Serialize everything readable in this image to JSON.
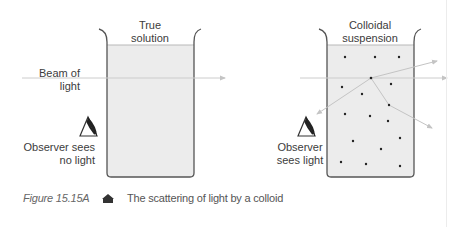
{
  "figure": {
    "caption": {
      "number": "Figure 15.15A",
      "text": "The scattering of light by a colloid"
    },
    "panels": [
      {
        "id": "true-solution",
        "title_line1": "True",
        "title_line2": "solution",
        "beam_label_line1": "Beam of",
        "beam_label_line2": "light",
        "observer_line1": "Observer sees",
        "observer_line2": "no light"
      },
      {
        "id": "colloidal-suspension",
        "title_line1": "Colloidal",
        "title_line2": "suspension",
        "observer_line1": "Observer",
        "observer_line2": "sees light",
        "particle_count": 16
      }
    ]
  },
  "colors": {
    "liquid": "#ececec",
    "beaker_outline": "#555555",
    "beam": "#c8c8c8",
    "particle": "#222222",
    "text": "#3c3c3c"
  }
}
